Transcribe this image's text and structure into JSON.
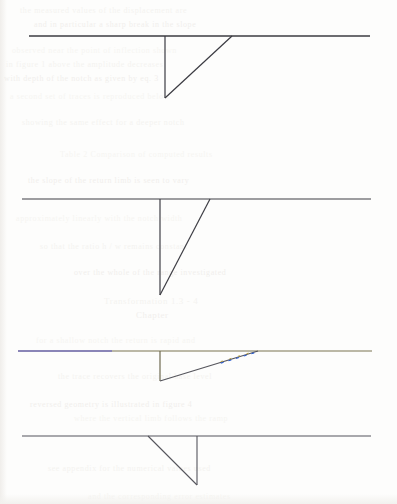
{
  "page": {
    "width": 397,
    "height": 504,
    "background_color": "#fdfdfc",
    "media": "scanned paper with reverse-side bleed-through"
  },
  "colors": {
    "ink_dark": "#3b3b42",
    "ink_medium": "#55555c",
    "ink_light": "#6b6b70",
    "olive": "#7a7451",
    "blue_violet": "#5a52c8",
    "cyan_fringe": "#2f5fd0",
    "yellow_fringe": "#b8a13a",
    "ghost_text": "#f3f2ef"
  },
  "figures": [
    {
      "name": "figure-1",
      "label": "",
      "baseline": {
        "x1": 29,
        "y": 36,
        "x2": 370,
        "color": "#3b3b42",
        "width": 1.3
      },
      "vertical": {
        "x": 165,
        "y_top": 36,
        "y_bottom": 98,
        "color": "#3b3b42",
        "width": 1.2
      },
      "diagonal": {
        "x1": 165,
        "y1": 98,
        "x2": 232,
        "y2": 36,
        "color": "#3b3b42",
        "width": 1.2
      },
      "orientation": "vertical-left",
      "notch_depth": 62,
      "notch_width": 67
    },
    {
      "name": "figure-2",
      "label": "",
      "baseline": {
        "x1": 22,
        "y": 199,
        "x2": 371,
        "color": "#3e3e45",
        "width": 1.2
      },
      "vertical": {
        "x": 160,
        "y_top": 199,
        "y_bottom": 295,
        "color": "#3e3e45",
        "width": 1.2
      },
      "diagonal": {
        "x1": 160,
        "y1": 295,
        "x2": 210,
        "y2": 199,
        "color": "#3e3e45",
        "width": 1.2
      },
      "orientation": "vertical-left",
      "notch_depth": 96,
      "notch_width": 50
    },
    {
      "name": "figure-3",
      "label": "",
      "baseline": {
        "x1": 18,
        "y": 351,
        "x2": 372,
        "color": "#7a7451",
        "width": 1.2
      },
      "baseline_left_segment": {
        "x1": 18,
        "x2": 112,
        "color": "#5a52c8"
      },
      "vertical": {
        "x": 160,
        "y_top": 351,
        "y_bottom": 381,
        "color": "#6f6a50",
        "width": 1.2
      },
      "diagonal": {
        "x1": 160,
        "y1": 381,
        "x2": 258,
        "y2": 351,
        "color": "#55555c",
        "width": 1.2
      },
      "diagonal_fringe": {
        "from_fraction": 0.62,
        "to_fraction": 0.97,
        "color_a": "#2f5fd0",
        "color_b": "#b8a13a"
      },
      "orientation": "vertical-left",
      "notch_depth": 30,
      "notch_width": 98,
      "note": "colour-fringed scan line"
    },
    {
      "name": "figure-4",
      "label": "",
      "baseline": {
        "x1": 22,
        "y": 436,
        "x2": 371,
        "color": "#55555c",
        "width": 1.1
      },
      "vertical": {
        "x": 197,
        "y_top": 436,
        "y_bottom": 485,
        "color": "#55555c",
        "width": 1.1
      },
      "diagonal": {
        "x1": 148,
        "y1": 436,
        "x2": 197,
        "y2": 485,
        "color": "#55555c",
        "width": 1.1
      },
      "orientation": "vertical-right",
      "notch_depth": 49,
      "notch_width": 49
    }
  ],
  "ghost_text": {
    "description": "illegible faint bleed-through text from the reverse of the sheet",
    "lines": [
      {
        "text": "the  measured  values  of  the  displacement  are",
        "x": 20,
        "y": 6,
        "size": 8,
        "tone": "a"
      },
      {
        "text": "and  in  particular  a  sharp  break  in  the  slope",
        "x": 34,
        "y": 20,
        "size": 8,
        "tone": "b"
      },
      {
        "text": "observed  near  the  point  of  inflection  shown",
        "x": 12,
        "y": 46,
        "size": 8,
        "tone": "c"
      },
      {
        "text": "in  figure  1  above  the  amplitude  decreases",
        "x": 6,
        "y": 60,
        "size": 8,
        "tone": "a"
      },
      {
        "text": "with  depth  of  the  notch  as  given  by  eq. 3",
        "x": 4,
        "y": 74,
        "size": 8,
        "tone": "b"
      },
      {
        "text": "a  second  set  of  traces  is  reproduced  below",
        "x": 10,
        "y": 92,
        "size": 8,
        "tone": "c"
      },
      {
        "text": "showing  the  same  effect  for  a  deeper  notch",
        "x": 22,
        "y": 118,
        "size": 8,
        "tone": "a"
      },
      {
        "text": "Table  2   Comparison  of  computed  results",
        "x": 60,
        "y": 150,
        "size": 8,
        "tone": "c"
      },
      {
        "text": "the  slope  of  the  return  limb  is  seen  to  vary",
        "x": 28,
        "y": 176,
        "size": 8,
        "tone": "b"
      },
      {
        "text": "approximately  linearly  with  the  notch  width",
        "x": 16,
        "y": 214,
        "size": 8,
        "tone": "c"
      },
      {
        "text": "so  that  the  ratio  h / w  remains  constant",
        "x": 40,
        "y": 242,
        "size": 8,
        "tone": "a"
      },
      {
        "text": "over  the  whole  of  the  range  investigated",
        "x": 74,
        "y": 268,
        "size": 8,
        "tone": "b"
      },
      {
        "text": "Transformation  1.3 - 4",
        "x": 104,
        "y": 296,
        "size": 9,
        "tone": "a"
      },
      {
        "text": "Chapter",
        "x": 136,
        "y": 310,
        "size": 9,
        "tone": "b"
      },
      {
        "text": "for  a  shallow  notch  the  return  is  rapid  and",
        "x": 36,
        "y": 336,
        "size": 8,
        "tone": "c"
      },
      {
        "text": "the  trace  recovers  the  original  base  level",
        "x": 58,
        "y": 372,
        "size": 8,
        "tone": "a"
      },
      {
        "text": "reversed  geometry  is  illustrated  in  figure  4",
        "x": 30,
        "y": 400,
        "size": 8,
        "tone": "b"
      },
      {
        "text": "where  the  vertical  limb  follows  the  ramp",
        "x": 74,
        "y": 414,
        "size": 8,
        "tone": "c"
      },
      {
        "text": "see  appendix  for  the  numerical  values  used",
        "x": 48,
        "y": 464,
        "size": 8,
        "tone": "a"
      },
      {
        "text": "and  the  corresponding  error  estimates",
        "x": 88,
        "y": 492,
        "size": 8,
        "tone": "c"
      }
    ]
  }
}
